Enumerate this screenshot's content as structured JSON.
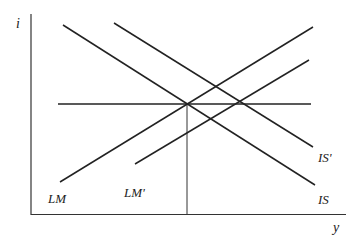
{
  "diagram": {
    "type": "IS-LM diagram",
    "axes": {
      "y_label": "i",
      "x_label": "y"
    },
    "curves": [
      {
        "id": "LM",
        "label": "LM",
        "x1": 60,
        "y1": 182,
        "x2": 313,
        "y2": 27
      },
      {
        "id": "LM_prime",
        "label": "LM'",
        "x1": 135,
        "y1": 164,
        "x2": 309,
        "y2": 60
      },
      {
        "id": "IS",
        "label": "IS",
        "x1": 63,
        "y1": 25,
        "x2": 315,
        "y2": 185
      },
      {
        "id": "IS_prime",
        "label": "IS'",
        "x1": 114,
        "y1": 23,
        "x2": 313,
        "y2": 147
      }
    ],
    "labels": {
      "lm": "LM",
      "lm_prime": "LM'",
      "is": "IS",
      "is_prime": "IS'"
    },
    "horizontal_line": {
      "y": 104,
      "x1": 58,
      "x2": 311
    },
    "vertical_line": {
      "x": 187,
      "y1": 104,
      "y2": 214
    },
    "line_color": "#222222"
  }
}
